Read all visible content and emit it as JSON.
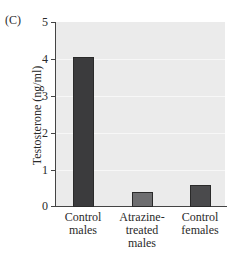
{
  "panel_label": "(C)",
  "chart_data": {
    "type": "bar",
    "title": "",
    "xlabel": "",
    "ylabel": "Testosterone (ng/ml)",
    "ylim": [
      0,
      5
    ],
    "yticks": [
      "0",
      "1",
      "2",
      "3",
      "4",
      "5"
    ],
    "categories": [
      "Control males",
      "Atrazine-treated males",
      "Control females"
    ],
    "category_lines": [
      [
        "Control",
        "males"
      ],
      [
        "Atrazine-",
        "treated",
        "males"
      ],
      [
        "Control",
        "females"
      ]
    ],
    "values": [
      4.05,
      0.4,
      0.6
    ],
    "bar_colors": [
      "#3b3b3d",
      "#6e6e70",
      "#4a4a4c"
    ],
    "grid": true,
    "legend": null
  }
}
